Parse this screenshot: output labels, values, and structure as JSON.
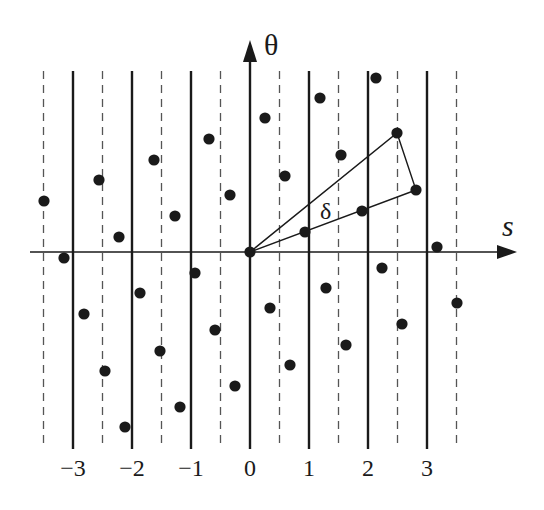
{
  "diagram": {
    "title": "",
    "axes": {
      "horizontal_label": "s",
      "vertical_label": "θ",
      "origin_label": "0"
    },
    "tick_labels": [
      "−3",
      "−2",
      "−1",
      "0",
      "1",
      "2",
      "3"
    ],
    "tick_values": [
      -3,
      -2,
      -1,
      0,
      1,
      2,
      3
    ],
    "annotation": "δ",
    "colors": {
      "ink": "#1a1a1a",
      "dashed": "#555555",
      "background": "#ffffff"
    },
    "layout": {
      "origin_px": [
        250,
        252
      ],
      "unit_px": 59,
      "grid_top": 71,
      "solid_bottom": 449,
      "dashed_bottom": 445,
      "s_axis_x": [
        30,
        515
      ],
      "theta_axis_top": 42,
      "solid_lines_at_s": [
        -3,
        -2,
        -1,
        0,
        1,
        2,
        3
      ],
      "dashed_lines_at_s": [
        -3.5,
        -2.5,
        -1.5,
        -0.5,
        0.5,
        1.5,
        2.5,
        3.5
      ]
    },
    "points_px": [
      [
        44,
        201
      ],
      [
        64,
        258
      ],
      [
        84,
        314
      ],
      [
        99,
        180
      ],
      [
        105,
        371
      ],
      [
        119,
        237
      ],
      [
        125,
        427
      ],
      [
        140,
        293
      ],
      [
        154,
        160
      ],
      [
        160,
        351
      ],
      [
        175,
        216
      ],
      [
        180,
        407
      ],
      [
        195,
        273
      ],
      [
        209,
        139
      ],
      [
        215,
        330
      ],
      [
        230,
        195
      ],
      [
        235,
        386
      ],
      [
        250,
        252
      ],
      [
        265,
        118
      ],
      [
        270,
        308
      ],
      [
        285,
        176
      ],
      [
        290,
        365
      ],
      [
        305,
        232
      ],
      [
        320,
        98
      ],
      [
        326,
        288
      ],
      [
        341,
        155
      ],
      [
        346,
        345
      ],
      [
        362,
        211
      ],
      [
        376,
        78
      ],
      [
        382,
        268
      ],
      [
        397,
        133
      ],
      [
        402,
        324
      ],
      [
        416,
        190
      ],
      [
        437,
        247
      ],
      [
        457,
        303
      ]
    ],
    "triangle_px": {
      "apex": [
        250,
        252
      ],
      "upper_vertex": [
        397,
        133
      ],
      "lower_vertex": [
        416,
        190
      ]
    }
  }
}
